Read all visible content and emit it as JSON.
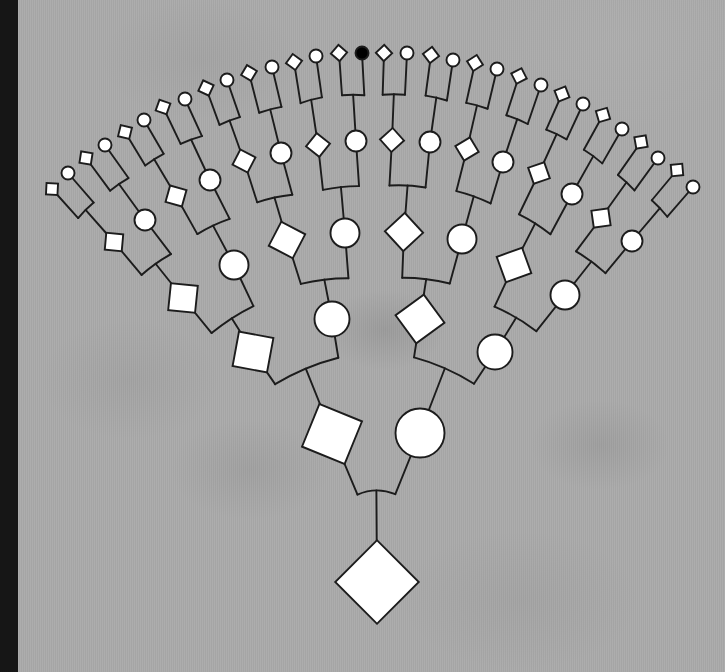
{
  "colors": {
    "background": "#aaaaaa",
    "border_strip": "#161616",
    "line": "#1c1c1c",
    "node_fill": "#ffffff",
    "affected_fill": "#000000"
  },
  "diagram": {
    "generations": [
      {
        "generation": 0,
        "individuals": [
          {
            "sex": "unspecified",
            "symbol": "diamond",
            "affected": false
          }
        ]
      },
      {
        "generation": 1,
        "individuals": [
          {
            "sex": "male",
            "symbol": "square",
            "affected": false
          },
          {
            "sex": "female",
            "symbol": "circle",
            "affected": false
          }
        ]
      },
      {
        "generation": 2,
        "individuals": [
          {
            "sex": "male",
            "symbol": "square",
            "affected": false
          },
          {
            "sex": "female",
            "symbol": "circle",
            "affected": false
          },
          {
            "sex": "male",
            "symbol": "square",
            "affected": false
          },
          {
            "sex": "female",
            "symbol": "circle",
            "affected": false
          }
        ]
      },
      {
        "generation": 3,
        "individuals": [
          {
            "sex": "male",
            "symbol": "square",
            "affected": false
          },
          {
            "sex": "female",
            "symbol": "circle",
            "affected": false
          },
          {
            "sex": "male",
            "symbol": "square",
            "affected": false
          },
          {
            "sex": "female",
            "symbol": "circle",
            "affected": false
          },
          {
            "sex": "male",
            "symbol": "square",
            "affected": false
          },
          {
            "sex": "female",
            "symbol": "circle",
            "affected": false
          },
          {
            "sex": "male",
            "symbol": "square",
            "affected": false
          },
          {
            "sex": "female",
            "symbol": "circle",
            "affected": false
          }
        ]
      },
      {
        "generation": 4,
        "individuals": [
          {
            "sex": "male",
            "symbol": "square",
            "affected": false
          },
          {
            "sex": "female",
            "symbol": "circle",
            "affected": false
          },
          {
            "sex": "male",
            "symbol": "square",
            "affected": false
          },
          {
            "sex": "female",
            "symbol": "circle",
            "affected": false
          },
          {
            "sex": "male",
            "symbol": "square",
            "affected": false
          },
          {
            "sex": "female",
            "symbol": "circle",
            "affected": false
          },
          {
            "sex": "male",
            "symbol": "square",
            "affected": false
          },
          {
            "sex": "female",
            "symbol": "circle",
            "affected": false
          },
          {
            "sex": "male",
            "symbol": "square",
            "affected": false
          },
          {
            "sex": "female",
            "symbol": "circle",
            "affected": false
          },
          {
            "sex": "male",
            "symbol": "square",
            "affected": false
          },
          {
            "sex": "female",
            "symbol": "circle",
            "affected": false
          },
          {
            "sex": "male",
            "symbol": "square",
            "affected": false
          },
          {
            "sex": "female",
            "symbol": "circle",
            "affected": false
          },
          {
            "sex": "male",
            "symbol": "square",
            "affected": false
          },
          {
            "sex": "female",
            "symbol": "circle",
            "affected": false
          }
        ]
      },
      {
        "generation": 5,
        "individuals": [
          {
            "sex": "male",
            "symbol": "square",
            "affected": false
          },
          {
            "sex": "female",
            "symbol": "circle",
            "affected": false
          },
          {
            "sex": "male",
            "symbol": "square",
            "affected": false
          },
          {
            "sex": "female",
            "symbol": "circle",
            "affected": false
          },
          {
            "sex": "male",
            "symbol": "square",
            "affected": false
          },
          {
            "sex": "female",
            "symbol": "circle",
            "affected": false
          },
          {
            "sex": "male",
            "symbol": "square",
            "affected": false
          },
          {
            "sex": "female",
            "symbol": "circle",
            "affected": false
          },
          {
            "sex": "male",
            "symbol": "square",
            "affected": false
          },
          {
            "sex": "female",
            "symbol": "circle",
            "affected": false
          },
          {
            "sex": "male",
            "symbol": "square",
            "affected": false
          },
          {
            "sex": "female",
            "symbol": "circle",
            "affected": false
          },
          {
            "sex": "male",
            "symbol": "square",
            "affected": false
          },
          {
            "sex": "female",
            "symbol": "circle",
            "affected": false
          },
          {
            "sex": "male",
            "symbol": "square",
            "affected": false
          },
          {
            "sex": "female",
            "symbol": "circle",
            "affected": true
          },
          {
            "sex": "male",
            "symbol": "square",
            "affected": false
          },
          {
            "sex": "female",
            "symbol": "circle",
            "affected": false
          },
          {
            "sex": "male",
            "symbol": "square",
            "affected": false
          },
          {
            "sex": "female",
            "symbol": "circle",
            "affected": false
          },
          {
            "sex": "male",
            "symbol": "square",
            "affected": false
          },
          {
            "sex": "female",
            "symbol": "circle",
            "affected": false
          },
          {
            "sex": "male",
            "symbol": "square",
            "affected": false
          },
          {
            "sex": "female",
            "symbol": "circle",
            "affected": false
          },
          {
            "sex": "male",
            "symbol": "square",
            "affected": false
          },
          {
            "sex": "female",
            "symbol": "circle",
            "affected": false
          },
          {
            "sex": "male",
            "symbol": "square",
            "affected": false
          },
          {
            "sex": "female",
            "symbol": "circle",
            "affected": false
          },
          {
            "sex": "male",
            "symbol": "square",
            "affected": false
          },
          {
            "sex": "female",
            "symbol": "circle",
            "affected": false
          },
          {
            "sex": "male",
            "symbol": "square",
            "affected": false
          },
          {
            "sex": "female",
            "symbol": "circle",
            "affected": false
          }
        ]
      }
    ]
  }
}
